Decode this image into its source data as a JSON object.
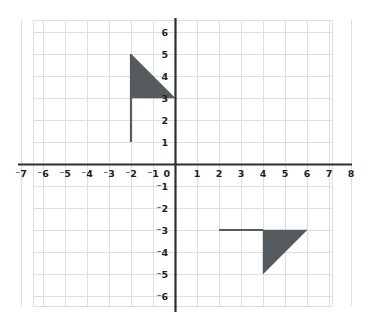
{
  "figure": {
    "kind": "coordinate-plane-with-shapes",
    "background_color": "#ffffff",
    "grid_color": "#dedede",
    "axis_color": "#2e2e2e",
    "shape_fill_color": "#555b5e",
    "label_color": "#231f20"
  },
  "axes": {
    "x_label_text": "",
    "y_label_text": "",
    "origin_label": "0",
    "x_ticks": [
      {
        "value": -7,
        "label": "⁻7"
      },
      {
        "value": -6,
        "label": "⁻6"
      },
      {
        "value": -5,
        "label": "⁻5"
      },
      {
        "value": -4,
        "label": "⁻4"
      },
      {
        "value": -3,
        "label": "⁻3"
      },
      {
        "value": -2,
        "label": "⁻2"
      },
      {
        "value": -1,
        "label": "⁻1"
      },
      {
        "value": 1,
        "label": "1"
      },
      {
        "value": 2,
        "label": "2"
      },
      {
        "value": 3,
        "label": "3"
      },
      {
        "value": 4,
        "label": "4"
      },
      {
        "value": 5,
        "label": "5"
      },
      {
        "value": 6,
        "label": "6"
      },
      {
        "value": 7,
        "label": "7"
      },
      {
        "value": 8,
        "label": "8"
      }
    ],
    "y_ticks": [
      {
        "value": 6,
        "label": "6"
      },
      {
        "value": 5,
        "label": "5"
      },
      {
        "value": 4,
        "label": "4"
      },
      {
        "value": 3,
        "label": "3"
      },
      {
        "value": 2,
        "label": "2"
      },
      {
        "value": 1,
        "label": "1"
      },
      {
        "value": -1,
        "label": "⁻1"
      },
      {
        "value": -2,
        "label": "⁻2"
      },
      {
        "value": -3,
        "label": "⁻3"
      },
      {
        "value": -4,
        "label": "⁻4"
      },
      {
        "value": -5,
        "label": "⁻5"
      },
      {
        "value": -6,
        "label": "⁻6"
      }
    ]
  },
  "chart_data": {
    "type": "scatter",
    "title": "",
    "xlabel": "",
    "ylabel": "",
    "grid": true,
    "legend": null,
    "xlim": [
      -7.5,
      8.5
    ],
    "ylim": [
      -6.5,
      6.7
    ],
    "x_tick_values": [
      -7,
      -6,
      -5,
      -4,
      -3,
      -2,
      -1,
      0,
      1,
      2,
      3,
      4,
      5,
      6,
      7,
      8
    ],
    "y_tick_values": [
      6,
      5,
      4,
      3,
      2,
      1,
      0,
      -1,
      -2,
      -3,
      -4,
      -5,
      -6
    ],
    "grid_step": 1,
    "series": [
      {
        "name": "flag-preimage",
        "description": "Flag figure in the second quadrant: vertical pole with right triangle banner",
        "parts": [
          {
            "name": "pole",
            "geometry": "segment",
            "points": [
              [
                -2,
                1
              ],
              [
                -2,
                5
              ]
            ]
          },
          {
            "name": "banner",
            "geometry": "filled-triangle",
            "points": [
              [
                -2,
                5
              ],
              [
                -2,
                3
              ],
              [
                0,
                3
              ]
            ]
          }
        ]
      },
      {
        "name": "flag-image",
        "description": "Rotated flag figure in the fourth quadrant: horizontal pole with right triangle banner",
        "parts": [
          {
            "name": "pole",
            "geometry": "segment",
            "points": [
              [
                2,
                -3
              ],
              [
                4,
                -3
              ]
            ]
          },
          {
            "name": "banner",
            "geometry": "filled-triangle",
            "points": [
              [
                4,
                -3
              ],
              [
                6,
                -3
              ],
              [
                4,
                -5
              ]
            ]
          }
        ]
      }
    ]
  },
  "geometry_pixels": {
    "origin_x": 175,
    "origin_y": 164,
    "unit": 22,
    "grid_left": 33,
    "grid_right": 332,
    "grid_top": 20,
    "grid_bottom": 306,
    "axis_x_left": 18,
    "axis_x_right": 352,
    "axis_y_top": 18,
    "axis_y_bottom": 312
  }
}
